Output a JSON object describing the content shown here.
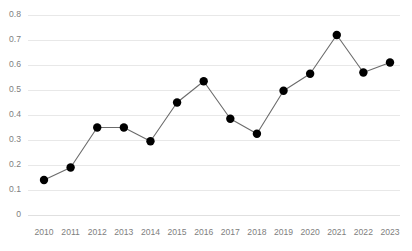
{
  "chart_data": {
    "type": "line",
    "title": "",
    "subtitle": "",
    "xlabel": "",
    "ylabel": "",
    "categories": [
      "2010",
      "2011",
      "2012",
      "2013",
      "2014",
      "2015",
      "2016",
      "2017",
      "2018",
      "2019",
      "2020",
      "2021",
      "2022",
      "2023"
    ],
    "values": [
      0.14,
      0.19,
      0.35,
      0.35,
      0.295,
      0.45,
      0.535,
      0.385,
      0.325,
      0.497,
      0.565,
      0.72,
      0.57,
      0.61
    ],
    "series": [
      {
        "name": "Series 1",
        "values": [
          0.14,
          0.19,
          0.35,
          0.35,
          0.295,
          0.45,
          0.535,
          0.385,
          0.325,
          0.497,
          0.565,
          0.72,
          0.57,
          0.61
        ]
      }
    ],
    "ylim": [
      0,
      0.8
    ],
    "ytick_labels": [
      "0",
      "0.1",
      "0.2",
      "0.3",
      "0.4",
      "0.5",
      "0.6",
      "0.7",
      "0.8"
    ],
    "ytick_values": [
      0,
      0.1,
      0.2,
      0.3,
      0.4,
      0.5,
      0.6,
      0.7,
      0.8
    ],
    "xtick_labels": [
      "2010",
      "2011",
      "2012",
      "2013",
      "2014",
      "2015",
      "2016",
      "2017",
      "2018",
      "2019",
      "2020",
      "2021",
      "2022",
      "2023"
    ],
    "grid": "horizontal",
    "legend": "none",
    "annotations": [],
    "colors": {
      "line": "#6b6b6b",
      "marker": "#000000",
      "gridline": "#e8e8e8",
      "tick_text": "#808080",
      "background": "#ffffff"
    },
    "marker": "circle",
    "marker_size": 4.2
  },
  "layout": {
    "plot_left": 28,
    "plot_right": 400,
    "plot_top": 15,
    "plot_bottom": 215,
    "first_point_x": 44,
    "last_point_x": 390
  }
}
